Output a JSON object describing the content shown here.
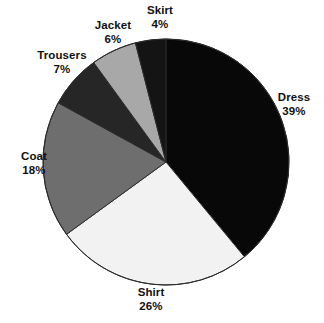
{
  "chart_data": {
    "type": "pie",
    "title": "",
    "subtitle": "",
    "xlabel": "",
    "ylabel": "",
    "legend_position": "none",
    "grid": false,
    "label_format": "name above percent",
    "start_angle_deg": 0,
    "direction": "clockwise",
    "units": "percent",
    "total": 100,
    "categories": [
      "Dress",
      "Shirt",
      "Coat",
      "Trousers",
      "Jacket",
      "Skirt"
    ],
    "values": [
      39,
      26,
      18,
      7,
      6,
      4
    ],
    "slices": [
      {
        "label": "Dress",
        "value": 39,
        "value_text": "39%",
        "color": "#080808"
      },
      {
        "label": "Shirt",
        "value": 26,
        "value_text": "26%",
        "color": "#f2f2f2"
      },
      {
        "label": "Coat",
        "value": 18,
        "value_text": "18%",
        "color": "#6e6e6e"
      },
      {
        "label": "Trousers",
        "value": 7,
        "value_text": "7%",
        "color": "#262626"
      },
      {
        "label": "Jacket",
        "value": 6,
        "value_text": "6%",
        "color": "#a8a8a8"
      },
      {
        "label": "Skirt",
        "value": 4,
        "value_text": "4%",
        "color": "#141414"
      }
    ],
    "geometry": {
      "center_x": 166,
      "center_y": 162,
      "radius": 123,
      "outline_color": "#2b2b2b",
      "outline_width": 1
    },
    "background_color": "#ffffff"
  }
}
